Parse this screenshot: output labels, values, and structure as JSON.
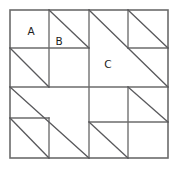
{
  "figure": {
    "type": "geometric-diagram",
    "background_color": "#ffffff",
    "line_color": "#6b6b6b",
    "diagonal_color": "#59595c",
    "label_color": "#1c1c1c",
    "canvas": {
      "width": 177,
      "height": 169
    },
    "outer_square": {
      "x": 10,
      "y": 10,
      "width": 158,
      "height": 148
    },
    "labels": [
      {
        "id": "label-a",
        "text": "A",
        "x": 31,
        "y": 32
      },
      {
        "id": "label-b",
        "text": "B",
        "x": 59,
        "y": 42
      },
      {
        "id": "label-c",
        "text": "C",
        "x": 108,
        "y": 65
      }
    ],
    "grid_lines": [
      {
        "id": "center-horizontal",
        "x1": 10,
        "y1": 87,
        "x2": 168,
        "y2": 87
      },
      {
        "id": "center-vertical",
        "x1": 89,
        "y1": 10,
        "x2": 89,
        "y2": 158
      },
      {
        "id": "tl-vertical",
        "x1": 49,
        "y1": 10,
        "x2": 49,
        "y2": 87
      },
      {
        "id": "tl-horizontal",
        "x1": 10,
        "y1": 48,
        "x2": 89,
        "y2": 48
      },
      {
        "id": "tr-vertical",
        "x1": 128,
        "y1": 10,
        "x2": 128,
        "y2": 48
      },
      {
        "id": "tr-horizontal",
        "x1": 128,
        "y1": 48,
        "x2": 168,
        "y2": 48
      },
      {
        "id": "bl-horizontal",
        "x1": 10,
        "y1": 118,
        "x2": 49,
        "y2": 118
      },
      {
        "id": "bl-vertical",
        "x1": 49,
        "y1": 118,
        "x2": 49,
        "y2": 158
      },
      {
        "id": "br-vertical",
        "x1": 128,
        "y1": 87,
        "x2": 128,
        "y2": 158
      },
      {
        "id": "br-horizontal",
        "x1": 89,
        "y1": 122,
        "x2": 168,
        "y2": 122
      }
    ],
    "diagonals": [
      {
        "id": "diag-tl-small-upper",
        "x1": 49,
        "y1": 10,
        "x2": 89,
        "y2": 48
      },
      {
        "id": "diag-tl-small-lower",
        "x1": 10,
        "y1": 48,
        "x2": 49,
        "y2": 87
      },
      {
        "id": "diag-tr-large-c",
        "x1": 89,
        "y1": 10,
        "x2": 168,
        "y2": 87
      },
      {
        "id": "diag-tr-small",
        "x1": 128,
        "y1": 10,
        "x2": 168,
        "y2": 48
      },
      {
        "id": "diag-bl-large",
        "x1": 10,
        "y1": 87,
        "x2": 89,
        "y2": 158
      },
      {
        "id": "diag-bl-small",
        "x1": 10,
        "y1": 118,
        "x2": 49,
        "y2": 158
      },
      {
        "id": "diag-br-upper",
        "x1": 128,
        "y1": 87,
        "x2": 168,
        "y2": 122
      },
      {
        "id": "diag-br-lower",
        "x1": 89,
        "y1": 122,
        "x2": 128,
        "y2": 158
      }
    ]
  }
}
